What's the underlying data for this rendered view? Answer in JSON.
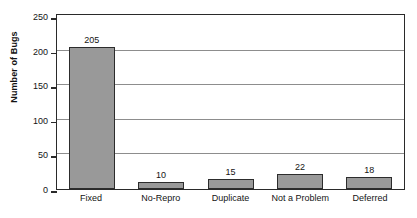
{
  "chart_data": {
    "type": "bar",
    "title": "",
    "title_note": "title cropped off top edge of screenshot",
    "categories": [
      "Fixed",
      "No-Repro",
      "Duplicate",
      "Not a Problem",
      "Deferred"
    ],
    "values": [
      205,
      10,
      15,
      22,
      18
    ],
    "xlabel": "",
    "ylabel": "Number of Bugs",
    "ylim": [
      0,
      250
    ],
    "yticks": [
      0,
      50,
      100,
      150,
      200,
      250
    ],
    "ytick_labels": [
      "0",
      "50",
      "100",
      "150",
      "200",
      "250"
    ],
    "grid": true,
    "grid_axis": "y",
    "legend": false,
    "data_labels": true,
    "bar_color": "#999999",
    "bar_border_color": "#2c2c2c",
    "axis_color": "#2a2a2a",
    "grid_color": "#8d8d8d",
    "background": "#ffffff"
  }
}
